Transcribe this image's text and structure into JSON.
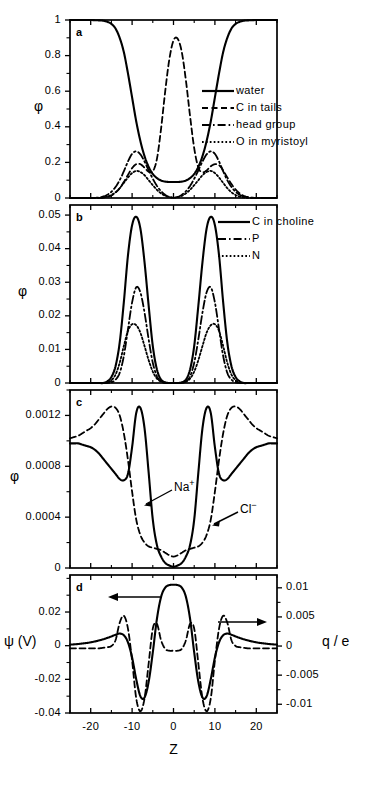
{
  "figure": {
    "xlabel": "Z",
    "x_ticks": [
      "-20",
      "-10",
      "0",
      "10",
      "20"
    ],
    "x_tick_values": [
      -20,
      -10,
      0,
      10,
      20
    ],
    "xlim": [
      -25,
      25
    ],
    "panel_labels": [
      "a",
      "b",
      "c",
      "d"
    ]
  },
  "panels": {
    "a": {
      "label": "a",
      "ylabel": "φ",
      "y_ticks": [
        "0",
        "0.2",
        "0.4",
        "0.6",
        "0.8",
        "1"
      ],
      "y_tick_values": [
        0,
        0.2,
        0.4,
        0.6,
        0.8,
        1
      ],
      "ylim": [
        0,
        1
      ],
      "legend": [
        {
          "label": "water",
          "style": "solid"
        },
        {
          "label": "C in tails",
          "style": "dashed"
        },
        {
          "label": "head group",
          "style": "dashdot"
        },
        {
          "label": "O in myristoyl",
          "style": "dotted"
        }
      ]
    },
    "b": {
      "label": "b",
      "ylabel": "φ",
      "y_ticks": [
        "0",
        "0.01",
        "0.02",
        "0.03",
        "0.04",
        "0.05"
      ],
      "y_tick_values": [
        0,
        0.01,
        0.02,
        0.03,
        0.04,
        0.05
      ],
      "ylim": [
        0,
        0.053
      ],
      "legend": [
        {
          "label": "C in choline",
          "style": "solid"
        },
        {
          "label": "P",
          "style": "dashdot"
        },
        {
          "label": "N",
          "style": "dotted"
        }
      ]
    },
    "c": {
      "label": "c",
      "ylabel": "φ",
      "y_ticks": [
        "0",
        "0.0004",
        "0.0008",
        "0.0012"
      ],
      "y_tick_values": [
        0,
        0.0004,
        0.0008,
        0.0012
      ],
      "ylim": [
        0,
        0.0014
      ],
      "annotations": [
        {
          "label": "Na",
          "sup": "+",
          "style": "solid"
        },
        {
          "label": "Cl",
          "sup": "−",
          "style": "dashed"
        }
      ]
    },
    "d": {
      "label": "d",
      "ylabel_left": "ψ (V)",
      "ylabel_right": "q / e",
      "y_ticks_left": [
        "-0.04",
        "-0.02",
        "0",
        "0.02"
      ],
      "y_tick_values_left": [
        -0.04,
        -0.02,
        0,
        0.02
      ],
      "ylim_left": [
        -0.04,
        0.042
      ],
      "y_ticks_right": [
        "-0.01",
        "-0.005",
        "0",
        "0.005",
        "0.01"
      ],
      "y_tick_values_right": [
        -0.01,
        -0.005,
        0,
        0.005,
        0.01
      ],
      "ylim_right": [
        -0.0115,
        0.0122
      ],
      "arrows": [
        {
          "name": "left-axis-arrow",
          "direction": "left"
        },
        {
          "name": "right-axis-arrow",
          "direction": "right"
        }
      ]
    }
  },
  "chart_data": [
    {
      "type": "line",
      "panel": "a",
      "title": "",
      "xlabel": "Z",
      "ylabel": "φ",
      "xlim": [
        -25,
        25
      ],
      "ylim": [
        0,
        1
      ],
      "grid": false,
      "legend_position": "right",
      "x": [
        -25,
        -24,
        -23,
        -22,
        -21,
        -20,
        -19,
        -18,
        -17,
        -16,
        -15,
        -14,
        -13,
        -12,
        -11,
        -10,
        -9,
        -8,
        -7,
        -6,
        -5,
        -4,
        -3,
        -2,
        -1,
        0,
        1,
        2,
        3,
        4,
        5,
        6,
        7,
        8,
        9,
        10,
        11,
        12,
        13,
        14,
        15,
        16,
        17,
        18,
        19,
        20,
        21,
        22,
        23,
        24,
        25
      ],
      "series": [
        {
          "name": "water",
          "style": "solid",
          "values": [
            1,
            1,
            1,
            1,
            1,
            1,
            0.999,
            0.998,
            0.996,
            0.99,
            0.978,
            0.952,
            0.9,
            0.82,
            0.7,
            0.565,
            0.43,
            0.32,
            0.235,
            0.175,
            0.135,
            0.112,
            0.098,
            0.092,
            0.09,
            0.09,
            0.09,
            0.092,
            0.098,
            0.112,
            0.135,
            0.175,
            0.235,
            0.32,
            0.43,
            0.565,
            0.7,
            0.82,
            0.9,
            0.952,
            0.978,
            0.99,
            0.996,
            0.998,
            0.999,
            1,
            1,
            1,
            1,
            1,
            1
          ]
        },
        {
          "name": "C in tails",
          "style": "dashed",
          "values": [
            0,
            0,
            0,
            0,
            0,
            0,
            0,
            0,
            0.002,
            0.006,
            0.014,
            0.03,
            0.055,
            0.09,
            0.13,
            0.168,
            0.19,
            0.19,
            0.17,
            0.148,
            0.15,
            0.22,
            0.39,
            0.6,
            0.78,
            0.885,
            0.895,
            0.82,
            0.66,
            0.46,
            0.28,
            0.17,
            0.145,
            0.155,
            0.178,
            0.19,
            0.185,
            0.155,
            0.115,
            0.078,
            0.048,
            0.026,
            0.012,
            0.005,
            0.002,
            0,
            0,
            0,
            0,
            0,
            0
          ]
        },
        {
          "name": "head group",
          "style": "dashdot",
          "values": [
            0,
            0,
            0,
            0,
            0,
            0,
            0.001,
            0.003,
            0.008,
            0.018,
            0.035,
            0.062,
            0.1,
            0.15,
            0.205,
            0.248,
            0.262,
            0.245,
            0.205,
            0.155,
            0.108,
            0.068,
            0.038,
            0.018,
            0.006,
            0.002,
            0.006,
            0.018,
            0.038,
            0.068,
            0.108,
            0.155,
            0.205,
            0.245,
            0.262,
            0.248,
            0.205,
            0.15,
            0.1,
            0.062,
            0.035,
            0.018,
            0.008,
            0.003,
            0.001,
            0,
            0,
            0,
            0,
            0,
            0
          ]
        },
        {
          "name": "O in myristoyl",
          "style": "dotted",
          "values": [
            0,
            0,
            0,
            0,
            0,
            0,
            0,
            0.001,
            0.003,
            0.008,
            0.017,
            0.032,
            0.055,
            0.085,
            0.115,
            0.14,
            0.152,
            0.146,
            0.128,
            0.1,
            0.072,
            0.046,
            0.026,
            0.012,
            0.005,
            0.002,
            0.005,
            0.012,
            0.026,
            0.046,
            0.072,
            0.1,
            0.128,
            0.146,
            0.152,
            0.14,
            0.115,
            0.085,
            0.055,
            0.032,
            0.017,
            0.008,
            0.003,
            0.001,
            0,
            0,
            0,
            0,
            0,
            0
          ]
        }
      ]
    },
    {
      "type": "line",
      "panel": "b",
      "title": "",
      "xlabel": "Z",
      "ylabel": "φ",
      "xlim": [
        -25,
        25
      ],
      "ylim": [
        0,
        0.053
      ],
      "grid": false,
      "legend_position": "right",
      "x": [
        -25,
        -24,
        -23,
        -22,
        -21,
        -20,
        -19,
        -18,
        -17,
        -16,
        -15,
        -14,
        -13,
        -12,
        -11,
        -10,
        -9,
        -8,
        -7,
        -6,
        -5,
        -4,
        -3,
        -2,
        -1,
        0,
        1,
        2,
        3,
        4,
        5,
        6,
        7,
        8,
        9,
        10,
        11,
        12,
        13,
        14,
        15,
        16,
        17,
        18,
        19,
        20,
        21,
        22,
        23,
        24,
        25
      ],
      "series": [
        {
          "name": "C in choline",
          "style": "solid",
          "values": [
            0,
            0,
            0,
            0,
            0,
            0,
            0,
            0,
            0,
            0.0005,
            0.0018,
            0.005,
            0.012,
            0.024,
            0.038,
            0.047,
            0.0495,
            0.046,
            0.036,
            0.023,
            0.011,
            0.004,
            0.001,
            0.0002,
            0,
            0,
            0,
            0.0002,
            0.001,
            0.004,
            0.011,
            0.023,
            0.036,
            0.046,
            0.0495,
            0.047,
            0.038,
            0.024,
            0.012,
            0.005,
            0.0018,
            0.0005,
            0,
            0,
            0,
            0,
            0,
            0,
            0,
            0,
            0
          ]
        },
        {
          "name": "P",
          "style": "dashdot",
          "values": [
            0,
            0,
            0,
            0,
            0,
            0,
            0,
            0,
            0,
            0,
            0.0002,
            0.001,
            0.003,
            0.008,
            0.016,
            0.024,
            0.0285,
            0.027,
            0.021,
            0.013,
            0.006,
            0.002,
            0.0005,
            0,
            0,
            0,
            0,
            0,
            0.0005,
            0.002,
            0.006,
            0.013,
            0.021,
            0.027,
            0.0285,
            0.024,
            0.016,
            0.008,
            0.003,
            0.001,
            0.0002,
            0,
            0,
            0,
            0,
            0,
            0,
            0,
            0,
            0,
            0
          ]
        },
        {
          "name": "N",
          "style": "dotted",
          "values": [
            0,
            0,
            0,
            0,
            0,
            0,
            0,
            0,
            0,
            0.0002,
            0.0008,
            0.0025,
            0.006,
            0.011,
            0.0155,
            0.0175,
            0.0172,
            0.015,
            0.011,
            0.0068,
            0.0034,
            0.0013,
            0.0004,
            0,
            0,
            0,
            0,
            0,
            0.0004,
            0.0013,
            0.0034,
            0.0068,
            0.011,
            0.015,
            0.0172,
            0.0175,
            0.0155,
            0.011,
            0.006,
            0.0025,
            0.0008,
            0.0002,
            0,
            0,
            0,
            0,
            0,
            0,
            0,
            0,
            0
          ]
        }
      ]
    },
    {
      "type": "line",
      "panel": "c",
      "title": "",
      "xlabel": "Z",
      "ylabel": "φ",
      "xlim": [
        -25,
        25
      ],
      "ylim": [
        0,
        0.0014
      ],
      "grid": false,
      "legend_position": "inline-annotations",
      "x": [
        -25,
        -24,
        -23,
        -22,
        -21,
        -20,
        -19,
        -18,
        -17,
        -16,
        -15,
        -14,
        -13,
        -12,
        -11,
        -10,
        -9,
        -8,
        -7,
        -6,
        -5,
        -4,
        -3,
        -2,
        -1,
        0,
        1,
        2,
        3,
        4,
        5,
        6,
        7,
        8,
        9,
        10,
        11,
        12,
        13,
        14,
        15,
        16,
        17,
        18,
        19,
        20,
        21,
        22,
        23,
        24,
        25
      ],
      "series": [
        {
          "name": "Na+",
          "style": "solid",
          "values": [
            0.00098,
            0.00098,
            0.00098,
            0.00097,
            0.00096,
            0.00095,
            0.00093,
            0.0009,
            0.00086,
            0.00082,
            0.00078,
            0.00074,
            0.0007,
            0.00069,
            0.00074,
            0.00095,
            0.00122,
            0.00126,
            0.0011,
            0.00075,
            0.00038,
            0.00018,
            9e-05,
            4e-05,
            2e-05,
            1e-05,
            2e-05,
            4e-05,
            9e-05,
            0.00018,
            0.00038,
            0.00075,
            0.0011,
            0.00126,
            0.00122,
            0.00095,
            0.00074,
            0.00069,
            0.0007,
            0.00074,
            0.00078,
            0.00082,
            0.00086,
            0.0009,
            0.00093,
            0.00095,
            0.00096,
            0.00097,
            0.00098,
            0.00098,
            0.00098
          ]
        },
        {
          "name": "Cl-",
          "style": "dashed",
          "values": [
            0.00102,
            0.00103,
            0.00104,
            0.00106,
            0.00108,
            0.0011,
            0.00113,
            0.00117,
            0.00121,
            0.00125,
            0.00127,
            0.00126,
            0.0012,
            0.00106,
            0.00085,
            0.0006,
            0.00038,
            0.00026,
            0.0002,
            0.00017,
            0.00016,
            0.00015,
            0.00014,
            0.00012,
            0.0001,
            9e-05,
            0.0001,
            0.00012,
            0.00014,
            0.00015,
            0.00016,
            0.00017,
            0.0002,
            0.00026,
            0.00038,
            0.0006,
            0.00085,
            0.00106,
            0.0012,
            0.00126,
            0.00127,
            0.00125,
            0.00121,
            0.00117,
            0.00113,
            0.0011,
            0.00108,
            0.00106,
            0.00104,
            0.00103,
            0.00102
          ]
        }
      ]
    },
    {
      "type": "line",
      "panel": "d",
      "title": "",
      "xlabel": "Z",
      "ylabel": "ψ (V)",
      "ylabel_secondary": "q / e",
      "xlim": [
        -25,
        25
      ],
      "ylim": [
        -0.04,
        0.042
      ],
      "ylim_secondary": [
        -0.0115,
        0.0122
      ],
      "grid": false,
      "legend_position": "axis-arrows",
      "x": [
        -25,
        -24,
        -23,
        -22,
        -21,
        -20,
        -19,
        -18,
        -17,
        -16,
        -15,
        -14,
        -13,
        -12,
        -11,
        -10,
        -9,
        -8,
        -7,
        -6,
        -5,
        -4,
        -3,
        -2,
        -1,
        0,
        1,
        2,
        3,
        4,
        5,
        6,
        7,
        8,
        9,
        10,
        11,
        12,
        13,
        14,
        15,
        16,
        17,
        18,
        19,
        20,
        21,
        22,
        23,
        24,
        25
      ],
      "series": [
        {
          "name": "psi",
          "axis": "left",
          "style": "solid",
          "values": [
            0.0006,
            0.0008,
            0.001,
            0.0013,
            0.0016,
            0.002,
            0.0025,
            0.0031,
            0.0038,
            0.0046,
            0.0055,
            0.0065,
            0.0072,
            0.0062,
            0.002,
            -0.007,
            -0.02,
            -0.03,
            -0.0308,
            -0.0215,
            -0.004,
            0.016,
            0.029,
            0.0345,
            0.036,
            0.0362,
            0.036,
            0.0345,
            0.029,
            0.016,
            -0.004,
            -0.0215,
            -0.0308,
            -0.03,
            -0.02,
            -0.007,
            0.002,
            0.0062,
            0.0072,
            0.0065,
            0.0055,
            0.0046,
            0.0038,
            0.0031,
            0.0025,
            0.002,
            0.0016,
            0.0013,
            0.001,
            0.0008,
            0.0006
          ]
        },
        {
          "name": "q/e",
          "axis": "right",
          "style": "dashed",
          "values": [
            -0.0004,
            -0.0004,
            -0.0004,
            -0.0004,
            -0.0004,
            -0.0004,
            -0.0004,
            -0.0004,
            -0.0003,
            -0.0002,
            0.0,
            0.001,
            0.004,
            0.0052,
            0.003,
            -0.0025,
            -0.009,
            -0.0112,
            -0.009,
            -0.003,
            0.003,
            0.0038,
            0.001,
            -0.0005,
            -0.0008,
            -0.0008,
            -0.0008,
            -0.0005,
            0.001,
            0.0038,
            0.003,
            -0.003,
            -0.009,
            -0.0112,
            -0.009,
            -0.0025,
            0.003,
            0.0052,
            0.004,
            0.001,
            0.0,
            -0.0002,
            -0.0003,
            -0.0004,
            -0.0004,
            -0.0004,
            -0.0004,
            -0.0004,
            -0.0004,
            -0.0004,
            -0.0004
          ]
        }
      ]
    }
  ]
}
